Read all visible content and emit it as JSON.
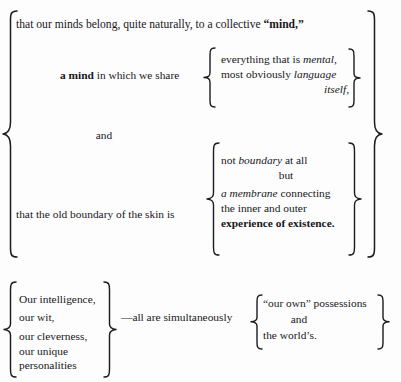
{
  "document": {
    "type": "bracketed-text-diagram",
    "background_color": "#fdfdfd",
    "text_color": "#17171b"
  },
  "block_upper": {
    "intro_line": {
      "pre": "that our minds belong, quite naturally, to a collective ",
      "bold": "“mind,”"
    },
    "group_one": {
      "stem_bold": "a mind",
      "stem_rest": " in which we share",
      "items": [
        {
          "pre": "everything that is ",
          "italic": "mental,",
          "post": "",
          "align": "left"
        },
        {
          "pre": "most obviously ",
          "italic": "language",
          "post": "",
          "align": "left"
        },
        {
          "pre": "",
          "italic": "itself,",
          "post": "",
          "align": "right"
        }
      ]
    },
    "conjunction": "and",
    "group_two": {
      "stem": "that the old boundary of the skin is",
      "items": [
        {
          "pre": "not ",
          "italic": "boundary",
          "post": " at all",
          "align": "left"
        },
        {
          "pre": "",
          "italic": "",
          "post": "but",
          "align": "center"
        },
        {
          "pre": "",
          "italic": "a membrane",
          "post": " connecting",
          "align": "left"
        },
        {
          "pre": "the inner and outer",
          "italic": "",
          "post": "",
          "align": "left"
        },
        {
          "pre": "",
          "bold": "experience of existence.",
          "post": "",
          "align": "left"
        }
      ]
    }
  },
  "block_lower": {
    "left_list": [
      "Our intelligence,",
      "our wit,",
      "our cleverness,",
      "our unique",
      "personalities"
    ],
    "connector": "—all are simultaneously",
    "right_list": [
      {
        "text": "“our own” possessions",
        "align": "left"
      },
      {
        "text": "and",
        "align": "center"
      },
      {
        "text": "the world’s.",
        "align": "left"
      }
    ]
  },
  "braces": {
    "outer_left": {
      "label": "outer-left-brace"
    },
    "outer_right": {
      "label": "outer-right-brace"
    },
    "g1_left": {
      "label": "group-one-left-brace"
    },
    "g1_right": {
      "label": "group-one-right-brace"
    },
    "g2_left": {
      "label": "group-two-left-brace"
    },
    "g2_right": {
      "label": "group-two-right-brace"
    },
    "list_left": {
      "label": "lower-list-left-brace"
    },
    "list_right": {
      "label": "lower-list-right-brace"
    },
    "g3_left": {
      "label": "lower-right-left-brace"
    },
    "g3_right": {
      "label": "lower-right-right-brace"
    }
  }
}
